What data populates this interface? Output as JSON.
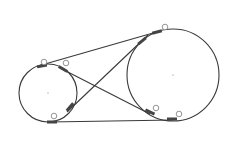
{
  "diagram": {
    "colors": {
      "stroke": "#3a3a3a",
      "marker": "#444444",
      "background": "#ffffff",
      "handle": "#888888"
    },
    "circles": [
      {
        "id": "small-pulley",
        "cx": 48,
        "cy": 93,
        "r": 29
      },
      {
        "id": "large-pulley",
        "cx": 173,
        "cy": 75,
        "r": 46
      }
    ],
    "lines": [
      {
        "id": "top-external-tangent",
        "x1": 38,
        "y1": 66,
        "x2": 160,
        "y2": 31
      },
      {
        "id": "bottom-external-tangent",
        "x1": 49,
        "y1": 122,
        "x2": 174,
        "y2": 120
      },
      {
        "id": "cross-tangent-a",
        "x1": 60,
        "y1": 68,
        "x2": 150,
        "y2": 114
      },
      {
        "id": "cross-tangent-b",
        "x1": 67,
        "y1": 112,
        "x2": 148,
        "y2": 35
      }
    ],
    "tangent_markers": [
      {
        "x": 42,
        "y": 66,
        "angle": -10
      },
      {
        "x": 63,
        "y": 69,
        "angle": 30
      },
      {
        "x": 70,
        "y": 107,
        "angle": -50
      },
      {
        "x": 52,
        "y": 122,
        "angle": 0
      },
      {
        "x": 157,
        "y": 32,
        "angle": -15
      },
      {
        "x": 142,
        "y": 41,
        "angle": -40
      },
      {
        "x": 150,
        "y": 112,
        "angle": 25
      },
      {
        "x": 172,
        "y": 119,
        "angle": 0
      }
    ],
    "handles": [
      {
        "x": 44,
        "y": 62
      },
      {
        "x": 66,
        "y": 63
      },
      {
        "x": 54,
        "y": 116
      },
      {
        "x": 165,
        "y": 27
      },
      {
        "x": 156,
        "y": 108
      },
      {
        "x": 179,
        "y": 114
      }
    ]
  }
}
